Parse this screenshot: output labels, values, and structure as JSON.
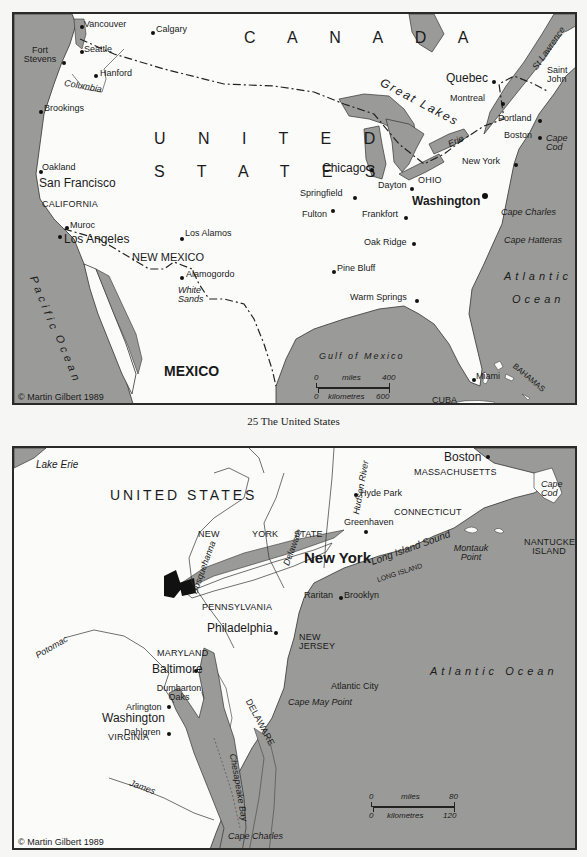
{
  "caption": "25  The United States",
  "map1": {
    "title": "The United States",
    "copyright": "© Martin Gilbert 1989",
    "colors": {
      "water": "#9a9a98",
      "land": "#fbfbfa",
      "border": "#2a2a2a"
    },
    "countries": {
      "canada": "C A N A D A",
      "us_line1": "U N I T E D",
      "us_line2": "S T A T E S",
      "mexico": "MEXICO",
      "cuba": "CUBA",
      "bahamas": "BAHAMAS"
    },
    "states": [
      "CALIFORNIA",
      "NEW MEXICO",
      "OHIO"
    ],
    "water": {
      "pacific1": "Pacific",
      "pacific2": "Ocean",
      "atlantic1": "Atlantic",
      "atlantic2": "Ocean",
      "gulf": "Gulf of Mexico",
      "great_lakes": "Great Lakes",
      "erie": "Erie",
      "st_lawrence": "St Lawrence",
      "columbia": "Columbia",
      "white_sands": "White Sands",
      "cape_cod": "Cape Cod",
      "cape_charles": "Cape Charles",
      "cape_hatteras": "Cape Hatteras"
    },
    "cities": [
      "Vancouver",
      "Calgary",
      "Seattle",
      "Fort Stevens",
      "Hanford",
      "Brookings",
      "Oakland",
      "San Francisco",
      "Muroc",
      "Los Angeles",
      "Los Alamos",
      "Alamogordo",
      "Chicago",
      "Springfield",
      "Fulton",
      "Dayton",
      "Frankfort",
      "Washington",
      "Oak Ridge",
      "Pine Bluff",
      "Warm Springs",
      "Miami",
      "Quebec",
      "Montreal",
      "Saint John",
      "Portland",
      "Boston",
      "New York"
    ],
    "scale": {
      "miles_label": "miles",
      "miles_start": "0",
      "miles_end": "400",
      "km_label": "kilometres",
      "km_start": "0",
      "km_end": "600"
    }
  },
  "map2": {
    "copyright": "© Martin Gilbert 1989",
    "countries": {
      "us": "UNITED STATES"
    },
    "states": [
      "NEW",
      "YORK",
      "STATE",
      "PENNSYLVANIA",
      "NEW JERSEY",
      "MARYLAND",
      "DELAWARE",
      "VIRGINIA",
      "CONNECTICUT",
      "MASSACHUSETTS",
      "NANTUCKET ISLAND",
      "LONG ISLAND"
    ],
    "water": {
      "lake_erie": "Lake Erie",
      "susquehanna": "Susquehanna",
      "delaware": "Delaware",
      "hudson": "Hudson River",
      "long_island_sound": "Long Island Sound",
      "montauk": "Montauk Point",
      "cape_cod": "Cape Cod",
      "atlantic": "Atlantic Ocean",
      "cape_may": "Cape May Point",
      "cape_charles": "Cape Charles",
      "potomac": "Potomac",
      "james": "James",
      "chesapeake": "Chesapeake Bay"
    },
    "cities": [
      "Boston",
      "Hyde Park",
      "Greenhaven",
      "New York",
      "Raritan",
      "Brooklyn",
      "Philadelphia",
      "Atlantic City",
      "Baltimore",
      "Dumbarton Oaks",
      "Arlington",
      "Washington",
      "Dahlgren"
    ],
    "scale": {
      "miles_label": "miles",
      "miles_start": "0",
      "miles_end": "80",
      "km_label": "kilometres",
      "km_start": "0",
      "km_end": "120"
    }
  }
}
